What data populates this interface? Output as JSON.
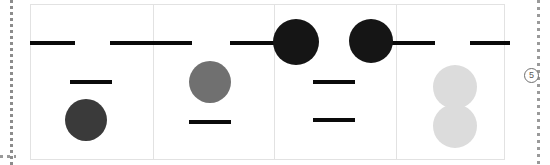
{
  "canvas": {
    "width": 550,
    "height": 165,
    "background_color": "#ffffff"
  },
  "guides": {
    "left_rail": {
      "x": 10,
      "y": 0,
      "height": 165,
      "color": "#9a9a9a",
      "style": "dotted"
    },
    "right_rail": {
      "x": 537,
      "y": 0,
      "height": 165,
      "color": "#9a9a9a",
      "style": "dotted"
    },
    "bottom_rail": {
      "x": 0,
      "y": 155,
      "width": 16,
      "color": "#9a9a9a",
      "style": "dotted"
    }
  },
  "sheet": {
    "x": 30,
    "y": 4,
    "width": 475,
    "height": 156,
    "border_color": "#e2e2e2",
    "background_color": "#ffffff"
  },
  "measures": [
    {
      "name": "measure-1",
      "barline_x": 153
    },
    {
      "name": "measure-2",
      "barline_x": 274
    },
    {
      "name": "measure-3",
      "barline_x": 396
    }
  ],
  "ledger_lines": [
    {
      "name": "ledger-line-1",
      "x": 30,
      "y": 41,
      "width": 45,
      "height": 4,
      "color": "#0a0a0a"
    },
    {
      "name": "ledger-line-2",
      "x": 110,
      "y": 41,
      "width": 82,
      "height": 4,
      "color": "#0a0a0a"
    },
    {
      "name": "ledger-line-3",
      "x": 230,
      "y": 41,
      "width": 60,
      "height": 4,
      "color": "#0a0a0a"
    },
    {
      "name": "ledger-line-4",
      "x": 385,
      "y": 41,
      "width": 50,
      "height": 4,
      "color": "#0a0a0a"
    },
    {
      "name": "ledger-line-5",
      "x": 470,
      "y": 41,
      "width": 40,
      "height": 4,
      "color": "#0a0a0a"
    },
    {
      "name": "ledger-line-6",
      "x": 70,
      "y": 80,
      "width": 42,
      "height": 4,
      "color": "#0a0a0a"
    },
    {
      "name": "ledger-line-7",
      "x": 189,
      "y": 120,
      "width": 42,
      "height": 4,
      "color": "#0a0a0a"
    },
    {
      "name": "ledger-line-8",
      "x": 313,
      "y": 80,
      "width": 42,
      "height": 4,
      "color": "#0a0a0a"
    },
    {
      "name": "ledger-line-9",
      "x": 313,
      "y": 118,
      "width": 42,
      "height": 4,
      "color": "#0a0a0a"
    }
  ],
  "noteheads": [
    {
      "name": "notehead-1",
      "cx": 86,
      "cy": 120,
      "r": 21,
      "color": "#3a3a3a",
      "shade": "dark-gray"
    },
    {
      "name": "notehead-2",
      "cx": 210,
      "cy": 82,
      "r": 21,
      "color": "#707070",
      "shade": "medium-gray"
    },
    {
      "name": "notehead-3",
      "cx": 296,
      "cy": 42,
      "r": 23,
      "color": "#151515",
      "shade": "black"
    },
    {
      "name": "notehead-4",
      "cx": 371,
      "cy": 41,
      "r": 22,
      "color": "#151515",
      "shade": "black"
    },
    {
      "name": "notehead-5",
      "cx": 455,
      "cy": 87,
      "r": 22,
      "color": "#dcdcdc",
      "shade": "light-gray"
    },
    {
      "name": "notehead-6",
      "cx": 455,
      "cy": 126,
      "r": 22,
      "color": "#dcdcdc",
      "shade": "light-gray"
    }
  ],
  "step_marker": {
    "label": "5",
    "x": 524,
    "y": 68,
    "size": 15,
    "border_color": "#6e6e6e",
    "text_color": "#5a5a5a"
  }
}
